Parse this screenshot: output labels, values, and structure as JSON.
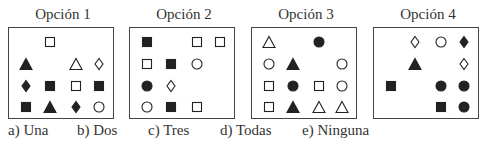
{
  "options": [
    {
      "label": "Opción 1",
      "grid": [
        [
          "",
          "square-outline",
          "",
          ""
        ],
        [
          "triangle-filled",
          "",
          "triangle-outline",
          "diamond-outline"
        ],
        [
          "diamond-filled",
          "square-filled",
          "square-outline",
          "square-filled"
        ],
        [
          "square-filled",
          "triangle-filled",
          "diamond-filled",
          "circle-outline"
        ]
      ]
    },
    {
      "label": "Opción 2",
      "grid": [
        [
          "square-filled",
          "",
          "square-outline",
          "square-outline"
        ],
        [
          "square-outline",
          "square-filled",
          "circle-outline",
          ""
        ],
        [
          "circle-filled",
          "diamond-outline",
          "",
          ""
        ],
        [
          "circle-outline",
          "square-filled",
          "square-outline",
          ""
        ]
      ]
    },
    {
      "label": "Opción 3",
      "grid": [
        [
          "triangle-outline",
          "",
          "circle-filled",
          ""
        ],
        [
          "circle-outline",
          "triangle-filled",
          "",
          "circle-outline"
        ],
        [
          "square-outline",
          "circle-filled",
          "square-outline",
          "circle-outline"
        ],
        [
          "square-outline",
          "triangle-filled",
          "triangle-outline",
          "triangle-outline"
        ]
      ]
    },
    {
      "label": "Opción 4",
      "grid": [
        [
          "",
          "diamond-outline",
          "circle-outline",
          "diamond-filled"
        ],
        [
          "",
          "triangle-filled",
          "",
          "diamond-outline"
        ],
        [
          "square-filled",
          "",
          "circle-filled",
          "circle-filled"
        ],
        [
          "",
          "",
          "square-filled",
          "circle-filled"
        ]
      ]
    }
  ],
  "answers": [
    "a) Una",
    "b) Dos",
    "c) Tres",
    "d) Todas",
    "e) Ninguna"
  ],
  "colors": {
    "ink": "#222222",
    "border": "#444444"
  }
}
